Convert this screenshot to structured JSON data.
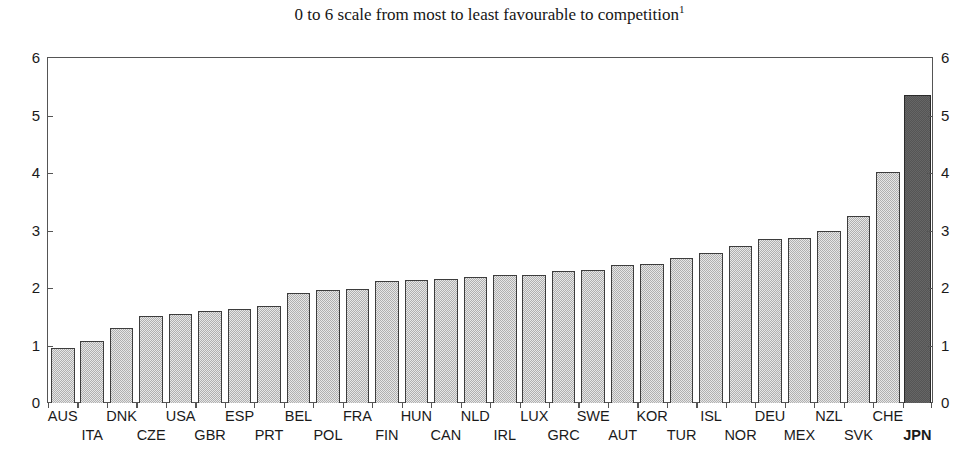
{
  "chart_data": {
    "type": "bar",
    "title": "0 to 6 scale from most to least favourable to competition",
    "title_superscript": "1",
    "xlabel": "",
    "ylabel": "",
    "ylim": [
      0,
      6
    ],
    "y_ticks": [
      0,
      1,
      2,
      3,
      4,
      5,
      6
    ],
    "y_ticks_labels": [
      "0",
      "1",
      "2",
      "3",
      "4",
      "5",
      "6"
    ],
    "y_axis_right_mirror": true,
    "grid": false,
    "legend": "none",
    "bar_fill_color": "#c9c9c9",
    "bar_edge_color": "#3d3d3d",
    "highlight_fill_color": "#555555",
    "highlight_category": "JPN",
    "label_rows": "alternating two rows; odd-index categories on lower row",
    "categories": [
      "AUS",
      "ITA",
      "DNK",
      "CZE",
      "USA",
      "GBR",
      "ESP",
      "PRT",
      "BEL",
      "POL",
      "FRA",
      "FIN",
      "HUN",
      "CAN",
      "NLD",
      "IRL",
      "LUX",
      "GRC",
      "SWE",
      "AUT",
      "KOR",
      "TUR",
      "ISL",
      "NOR",
      "DEU",
      "MEX",
      "NZL",
      "SVK",
      "CHE",
      "JPN"
    ],
    "values": [
      0.96,
      1.08,
      1.31,
      1.51,
      1.54,
      1.6,
      1.64,
      1.69,
      1.91,
      1.96,
      1.99,
      2.13,
      2.14,
      2.16,
      2.19,
      2.22,
      2.23,
      2.29,
      2.31,
      2.4,
      2.42,
      2.52,
      2.61,
      2.73,
      2.86,
      2.87,
      2.99,
      3.25,
      4.01,
      4.45
    ],
    "highlight_value": 5.35,
    "note": "Final bar (JPN) is shaded dark and reaches 5.35"
  }
}
